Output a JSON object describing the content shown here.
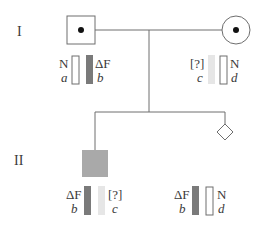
{
  "generations": [
    {
      "label": "I"
    },
    {
      "label": "II"
    }
  ],
  "colors": {
    "line": "#6e6e6e",
    "allele_deltaF": "#7a7a7a",
    "allele_unknown": "#e6e6e6",
    "allele_normal": "#ffffff",
    "affected_fill": "#a9a9a9",
    "dot": "#111111"
  },
  "individuals": {
    "father": {
      "shape": "square",
      "status": "carrier",
      "alleles": [
        {
          "name": "N",
          "letter": "a",
          "type": "normal"
        },
        {
          "name": "ΔF",
          "letter": "b",
          "type": "deltaF"
        }
      ]
    },
    "mother": {
      "shape": "circle",
      "status": "carrier",
      "alleles": [
        {
          "name": "[?]",
          "letter": "c",
          "type": "unknown"
        },
        {
          "name": "N",
          "letter": "d",
          "type": "normal"
        }
      ]
    },
    "son": {
      "shape": "square",
      "status": "affected",
      "alleles": [
        {
          "name": "ΔF",
          "letter": "b",
          "type": "deltaF"
        },
        {
          "name": "[?]",
          "letter": "c",
          "type": "unknown"
        }
      ]
    },
    "fetus": {
      "shape": "diamond",
      "status": "unknown-sex",
      "alleles": [
        {
          "name": "ΔF",
          "letter": "b",
          "type": "deltaF"
        },
        {
          "name": "N",
          "letter": "d",
          "type": "normal"
        }
      ]
    }
  }
}
